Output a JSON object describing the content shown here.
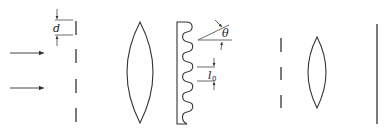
{
  "diagram": {
    "type": "optics-setup",
    "components": [
      {
        "name": "incident-light",
        "count": 2
      },
      {
        "name": "entrance-slit-array"
      },
      {
        "name": "converging-lens-1"
      },
      {
        "name": "reflection-grating"
      },
      {
        "name": "exit-slit-array"
      },
      {
        "name": "converging-lens-2"
      },
      {
        "name": "screen"
      }
    ],
    "labels": {
      "slit_spacing": "d",
      "blaze_angle": "θ",
      "groove_period": "l",
      "groove_period_sub": "0"
    }
  }
}
